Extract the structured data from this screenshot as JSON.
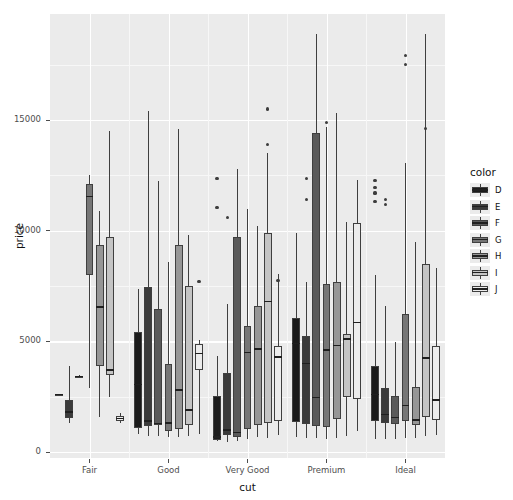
{
  "chart_data": {
    "type": "box",
    "title": "",
    "xlabel": "cut",
    "ylabel": "price",
    "grid": true,
    "legend_position": "right",
    "legend_title": "color",
    "categories": [
      "Fair",
      "Good",
      "Very Good",
      "Premium",
      "Ideal"
    ],
    "groups": [
      "D",
      "E",
      "F",
      "G",
      "H",
      "I",
      "J"
    ],
    "group_colors": [
      "#1a1a1a",
      "#3b3b3b",
      "#5a5a5a",
      "#767676",
      "#969696",
      "#c4c4c4",
      "#ececec"
    ],
    "ylim": [
      0,
      19000
    ],
    "yticks": [
      0,
      5000,
      10000,
      15000
    ],
    "ytick_labels": [
      "0",
      "5000",
      "10000",
      "15000"
    ],
    "xtick_labels": [
      "Fair",
      "Good",
      "Very Good",
      "Premium",
      "Ideal"
    ],
    "boxes": [
      {
        "cut": "Fair",
        "color": "D",
        "lower_whisker": 2600,
        "q1": 2590,
        "median": 2600,
        "q3": 2620,
        "upper_whisker": 2640,
        "outliers": []
      },
      {
        "cut": "Fair",
        "color": "E",
        "lower_whisker": 1300,
        "q1": 1520,
        "median": 1800,
        "q3": 2350,
        "upper_whisker": 3900,
        "outliers": []
      },
      {
        "cut": "Fair",
        "color": "F",
        "lower_whisker": 3380,
        "q1": 3400,
        "median": 3420,
        "q3": 3440,
        "upper_whisker": 3460,
        "outliers": []
      },
      {
        "cut": "Fair",
        "color": "G",
        "lower_whisker": 2900,
        "q1": 8000,
        "median": 11550,
        "q3": 12100,
        "upper_whisker": 12500,
        "outliers": []
      },
      {
        "cut": "Fair",
        "color": "H",
        "lower_whisker": 1600,
        "q1": 3880,
        "median": 6550,
        "q3": 9350,
        "upper_whisker": 10900,
        "outliers": []
      },
      {
        "cut": "Fair",
        "color": "I",
        "lower_whisker": 2500,
        "q1": 3500,
        "median": 3700,
        "q3": 9700,
        "upper_whisker": 14500,
        "outliers": []
      },
      {
        "cut": "Fair",
        "color": "J",
        "lower_whisker": 1300,
        "q1": 1420,
        "median": 1500,
        "q3": 1620,
        "upper_whisker": 1750,
        "outliers": []
      },
      {
        "cut": "Good",
        "color": "D",
        "lower_whisker": 800,
        "q1": 1080,
        "median": 3050,
        "q3": 5400,
        "upper_whisker": 7350,
        "outliers": []
      },
      {
        "cut": "Good",
        "color": "E",
        "lower_whisker": 700,
        "q1": 1180,
        "median": 1400,
        "q3": 7450,
        "upper_whisker": 15400,
        "outliers": []
      },
      {
        "cut": "Good",
        "color": "F",
        "lower_whisker": 700,
        "q1": 1230,
        "median": 1280,
        "q3": 6450,
        "upper_whisker": 12250,
        "outliers": []
      },
      {
        "cut": "Good",
        "color": "G",
        "lower_whisker": 700,
        "q1": 960,
        "median": 1310,
        "q3": 3960,
        "upper_whisker": 8580,
        "outliers": []
      },
      {
        "cut": "Good",
        "color": "H",
        "lower_whisker": 680,
        "q1": 1020,
        "median": 2800,
        "q3": 9350,
        "upper_whisker": 14600,
        "outliers": []
      },
      {
        "cut": "Good",
        "color": "I",
        "lower_whisker": 740,
        "q1": 1200,
        "median": 1900,
        "q3": 7500,
        "upper_whisker": 9800,
        "outliers": []
      },
      {
        "cut": "Good",
        "color": "J",
        "lower_whisker": 820,
        "q1": 3700,
        "median": 4450,
        "q3": 4900,
        "upper_whisker": 5050,
        "outliers": [
          7700
        ]
      },
      {
        "cut": "Very Good",
        "color": "D",
        "lower_whisker": 480,
        "q1": 560,
        "median": 680,
        "q3": 2550,
        "upper_whisker": 4350,
        "outliers": [
          11050,
          12350
        ]
      },
      {
        "cut": "Very Good",
        "color": "E",
        "lower_whisker": 450,
        "q1": 750,
        "median": 1000,
        "q3": 3550,
        "upper_whisker": 6700,
        "outliers": [
          10600
        ]
      },
      {
        "cut": "Very Good",
        "color": "F",
        "lower_whisker": 480,
        "q1": 680,
        "median": 890,
        "q3": 9700,
        "upper_whisker": 12800,
        "outliers": []
      },
      {
        "cut": "Very Good",
        "color": "G",
        "lower_whisker": 600,
        "q1": 1050,
        "median": 4500,
        "q3": 5700,
        "upper_whisker": 11000,
        "outliers": []
      },
      {
        "cut": "Very Good",
        "color": "H",
        "lower_whisker": 700,
        "q1": 1200,
        "median": 4650,
        "q3": 6600,
        "upper_whisker": 10200,
        "outliers": []
      },
      {
        "cut": "Very Good",
        "color": "I",
        "lower_whisker": 640,
        "q1": 1300,
        "median": 6800,
        "q3": 9900,
        "upper_whisker": 13500,
        "outliers": [
          13900,
          15500
        ]
      },
      {
        "cut": "Very Good",
        "color": "J",
        "lower_whisker": 780,
        "q1": 1400,
        "median": 4300,
        "q3": 4800,
        "upper_whisker": 8050,
        "outliers": [
          7750
        ]
      },
      {
        "cut": "Premium",
        "color": "D",
        "lower_whisker": 680,
        "q1": 1350,
        "median": 4900,
        "q3": 6050,
        "upper_whisker": 9900,
        "outliers": []
      },
      {
        "cut": "Premium",
        "color": "E",
        "lower_whisker": 620,
        "q1": 1250,
        "median": 4000,
        "q3": 5250,
        "upper_whisker": 7700,
        "outliers": [
          11400,
          12350
        ]
      },
      {
        "cut": "Premium",
        "color": "F",
        "lower_whisker": 620,
        "q1": 1180,
        "median": 2450,
        "q3": 14400,
        "upper_whisker": 18900,
        "outliers": []
      },
      {
        "cut": "Premium",
        "color": "G",
        "lower_whisker": 580,
        "q1": 1150,
        "median": 4600,
        "q3": 7600,
        "upper_whisker": 14700,
        "outliers": [
          14900
        ]
      },
      {
        "cut": "Premium",
        "color": "H",
        "lower_whisker": 640,
        "q1": 1480,
        "median": 4800,
        "q3": 7700,
        "upper_whisker": 15300,
        "outliers": []
      },
      {
        "cut": "Premium",
        "color": "I",
        "lower_whisker": 700,
        "q1": 2480,
        "median": 5100,
        "q3": 5350,
        "upper_whisker": 10400,
        "outliers": []
      },
      {
        "cut": "Premium",
        "color": "J",
        "lower_whisker": 960,
        "q1": 2400,
        "median": 5850,
        "q3": 10350,
        "upper_whisker": 12300,
        "outliers": []
      },
      {
        "cut": "Ideal",
        "color": "D",
        "lower_whisker": 600,
        "q1": 1400,
        "median": 2600,
        "q3": 3900,
        "upper_whisker": 8000,
        "outliers": [
          11300,
          11700,
          11950,
          12250
        ]
      },
      {
        "cut": "Ideal",
        "color": "E",
        "lower_whisker": 580,
        "q1": 1300,
        "median": 1700,
        "q3": 2900,
        "upper_whisker": 6600,
        "outliers": [
          11200,
          11400
        ]
      },
      {
        "cut": "Ideal",
        "color": "F",
        "lower_whisker": 600,
        "q1": 1250,
        "median": 1550,
        "q3": 2550,
        "upper_whisker": 4950,
        "outliers": []
      },
      {
        "cut": "Ideal",
        "color": "G",
        "lower_whisker": 620,
        "q1": 1400,
        "median": 2100,
        "q3": 6250,
        "upper_whisker": 13050,
        "outliers": [
          17500,
          17900
        ]
      },
      {
        "cut": "Ideal",
        "color": "H",
        "lower_whisker": 620,
        "q1": 1200,
        "median": 1450,
        "q3": 2950,
        "upper_whisker": 9500,
        "outliers": []
      },
      {
        "cut": "Ideal",
        "color": "I",
        "lower_whisker": 700,
        "q1": 1600,
        "median": 4250,
        "q3": 8500,
        "upper_whisker": 18900,
        "outliers": [
          14600
        ]
      },
      {
        "cut": "Ideal",
        "color": "J",
        "lower_whisker": 760,
        "q1": 1450,
        "median": 2350,
        "q3": 4800,
        "upper_whisker": 8300,
        "outliers": []
      }
    ]
  },
  "legend": {
    "title": "color",
    "items": [
      {
        "label": "D",
        "color": "#1a1a1a"
      },
      {
        "label": "E",
        "color": "#3b3b3b"
      },
      {
        "label": "F",
        "color": "#5a5a5a"
      },
      {
        "label": "G",
        "color": "#767676"
      },
      {
        "label": "H",
        "color": "#969696"
      },
      {
        "label": "I",
        "color": "#c4c4c4"
      },
      {
        "label": "J",
        "color": "#ececec"
      }
    ]
  },
  "theme": {
    "panel_bg": "#ebebeb",
    "grid_major": "#ffffff",
    "grid_minor": "#f7f7f7",
    "text": "#4d4d4d",
    "title_text": "#111111",
    "outline": "#3f3f3f"
  }
}
